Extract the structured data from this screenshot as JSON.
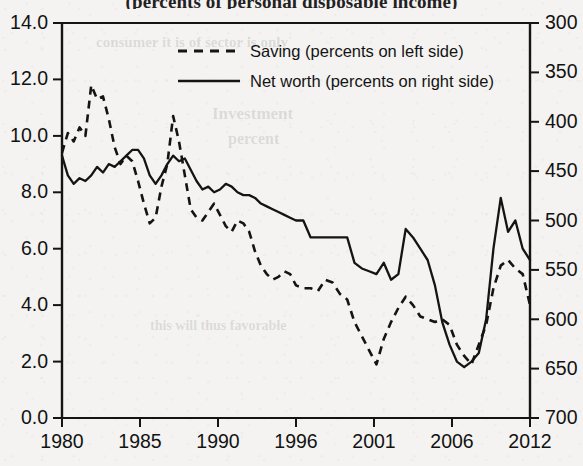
{
  "figure": {
    "title": "(percents of personal disposable income)",
    "title_clipped": true,
    "background_color": "#f4f3f1",
    "ink_color": "#141414"
  },
  "legend": {
    "position": "top-center",
    "entries": [
      {
        "label": "Saving (percents on left side)",
        "style": "dashed",
        "axis": "left"
      },
      {
        "label": "Net worth (percents on right side)",
        "style": "solid",
        "axis": "right"
      }
    ]
  },
  "axes": {
    "left": {
      "ticks": [
        "0.0",
        "2.0",
        "4.0",
        "6.0",
        "8.0",
        "10.0",
        "12.0",
        "14.0"
      ],
      "min": 0.0,
      "max": 14.0,
      "step": 2.0,
      "direction": "normal"
    },
    "right": {
      "ticks": [
        "300",
        "350",
        "400",
        "450",
        "500",
        "550",
        "600",
        "650",
        "700"
      ],
      "min": 300,
      "max": 700,
      "step": 50,
      "direction": "inverted"
    },
    "bottom": {
      "ticks": [
        "1980",
        "1985",
        "1990",
        "1996",
        "2001",
        "2006",
        "2012"
      ]
    }
  },
  "chart_data": {
    "type": "line",
    "title": "(percents of personal disposable income)",
    "xlabel": "",
    "ylabel": "",
    "xlim": [
      1980,
      2012
    ],
    "ylim": [
      0,
      14
    ],
    "y2lim": [
      700,
      300
    ],
    "y2_inverted": true,
    "grid": false,
    "legend_position": "top-center",
    "xticks": [
      1980,
      1985,
      1990,
      1996,
      2001,
      2006,
      2012
    ],
    "yticks": [
      0,
      2,
      4,
      6,
      8,
      10,
      12,
      14
    ],
    "y2ticks": [
      300,
      350,
      400,
      450,
      500,
      550,
      600,
      650,
      700
    ],
    "series": [
      {
        "name": "Saving (percents on left side)",
        "style": "dashed",
        "axis": "left",
        "units": "percent",
        "x": [
          1980.0,
          1980.4,
          1980.8,
          1981.2,
          1981.6,
          1982.0,
          1982.4,
          1982.8,
          1983.2,
          1983.6,
          1984.0,
          1984.4,
          1984.8,
          1985.2,
          1985.6,
          1986.0,
          1986.4,
          1986.8,
          1987.2,
          1987.6,
          1988.0,
          1988.4,
          1988.8,
          1989.2,
          1989.6,
          1990.0,
          1990.4,
          1990.8,
          1991.2,
          1991.6,
          1992.0,
          1992.4,
          1992.8,
          1993.2,
          1993.6,
          1994.0,
          1994.4,
          1994.8,
          1995.2,
          1995.6,
          1996.0,
          1996.5,
          1997.0,
          1997.5,
          1998.0,
          1998.5,
          1999.0,
          1999.5,
          2000.0,
          2000.5,
          2001.0,
          2001.5,
          2002.0,
          2002.5,
          2003.0,
          2003.5,
          2004.0,
          2004.5,
          2005.0,
          2005.5,
          2006.0,
          2006.5,
          2007.0,
          2007.5,
          2008.0,
          2008.5,
          2009.0,
          2009.5,
          2010.0,
          2010.5,
          2011.0,
          2011.5,
          2012.0
        ],
        "y": [
          9.4,
          10.1,
          9.8,
          10.3,
          10.0,
          11.8,
          11.3,
          11.4,
          10.6,
          9.6,
          9.0,
          9.3,
          9.1,
          8.4,
          7.6,
          6.9,
          7.1,
          8.2,
          9.0,
          10.7,
          9.8,
          8.6,
          7.4,
          7.1,
          7.0,
          7.3,
          7.6,
          7.2,
          6.8,
          6.6,
          7.0,
          6.9,
          6.6,
          5.9,
          5.4,
          5.1,
          4.9,
          5.0,
          5.2,
          5.1,
          4.7,
          4.6,
          4.6,
          4.5,
          4.9,
          4.8,
          4.4,
          4.2,
          3.4,
          2.9,
          2.4,
          1.9,
          2.8,
          3.4,
          3.9,
          4.3,
          4.0,
          3.6,
          3.5,
          3.4,
          3.5,
          3.3,
          2.6,
          2.2,
          1.9,
          2.6,
          3.3,
          4.6,
          5.4,
          5.6,
          5.3,
          5.1,
          4.0
        ]
      },
      {
        "name": "Net worth (percents on right side)",
        "style": "solid",
        "axis": "right",
        "units": "percent_of_disposable_income",
        "x": [
          1980.0,
          1980.4,
          1980.8,
          1981.2,
          1981.6,
          1982.0,
          1982.4,
          1982.8,
          1983.2,
          1983.6,
          1984.0,
          1984.4,
          1984.8,
          1985.2,
          1985.6,
          1986.0,
          1986.4,
          1986.8,
          1987.2,
          1987.6,
          1988.0,
          1988.4,
          1988.8,
          1989.2,
          1989.6,
          1990.0,
          1990.4,
          1990.8,
          1991.2,
          1991.6,
          1992.0,
          1992.4,
          1992.8,
          1993.2,
          1993.6,
          1994.0,
          1994.4,
          1994.8,
          1995.2,
          1995.6,
          1996.0,
          1996.5,
          1997.0,
          1997.5,
          1998.0,
          1998.5,
          1999.0,
          1999.5,
          2000.0,
          2000.5,
          2001.0,
          2001.5,
          2002.0,
          2002.5,
          2003.0,
          2003.5,
          2004.0,
          2004.5,
          2005.0,
          2005.5,
          2006.0,
          2006.5,
          2007.0,
          2007.5,
          2008.0,
          2008.5,
          2009.0,
          2009.5,
          2010.0,
          2010.5,
          2011.0,
          2011.5,
          2012.0
        ],
        "y_left_scale": [
          9.3,
          8.6,
          8.3,
          8.5,
          8.4,
          8.6,
          8.9,
          8.7,
          9.0,
          8.9,
          9.1,
          9.3,
          9.5,
          9.5,
          9.2,
          8.6,
          8.3,
          8.6,
          9.0,
          9.3,
          9.1,
          9.2,
          8.8,
          8.4,
          8.1,
          8.2,
          8.0,
          8.1,
          8.3,
          8.2,
          8.0,
          7.9,
          7.9,
          7.8,
          7.6,
          7.5,
          7.4,
          7.3,
          7.2,
          7.1,
          7.0,
          7.0,
          6.4,
          6.4,
          6.4,
          6.4,
          6.4,
          6.4,
          5.5,
          5.3,
          5.2,
          5.1,
          5.5,
          4.9,
          5.1,
          6.7,
          6.4,
          6.0,
          5.6,
          4.7,
          3.4,
          2.6,
          2.0,
          1.8,
          2.0,
          2.3,
          3.5,
          6.0,
          7.8,
          6.6,
          7.0,
          6.0,
          5.6
        ],
        "y_right_values": [
          455,
          487,
          500,
          491,
          496,
          487,
          474,
          482,
          470,
          474,
          466,
          457,
          450,
          450,
          462,
          487,
          500,
          487,
          470,
          457,
          466,
          461,
          478,
          496,
          509,
          505,
          513,
          509,
          500,
          505,
          513,
          518,
          518,
          522,
          531,
          535,
          539,
          544,
          548,
          552,
          557,
          557,
          583,
          583,
          583,
          583,
          583,
          583,
          622,
          631,
          635,
          639,
          622,
          648,
          639,
          570,
          583,
          600,
          618,
          657,
          713,
          765,
          800,
          809,
          800,
          787,
          735,
          626,
          548,
          600,
          583,
          626,
          644
        ]
      }
    ]
  }
}
